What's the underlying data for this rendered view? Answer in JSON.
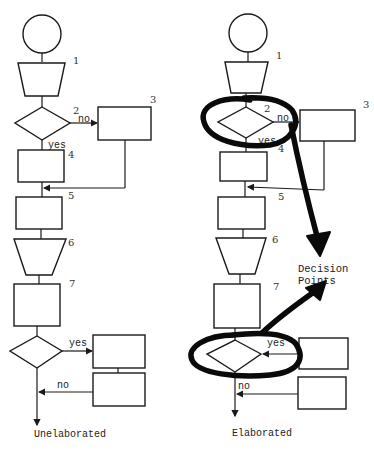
{
  "diagram": {
    "left": {
      "caption": "Unelaborated",
      "step_numbers": [
        "1",
        "2",
        "3",
        "4",
        "5",
        "6",
        "7"
      ],
      "labels": {
        "decision1_no": "no",
        "decision1_yes": "yes",
        "decision2_yes": "yes",
        "decision2_no": "no"
      }
    },
    "right": {
      "caption": "Elaborated",
      "step_numbers": [
        "1",
        "2",
        "3",
        "4",
        "5",
        "6",
        "7"
      ],
      "labels": {
        "decision1_no": "no",
        "decision1_yes": "yes",
        "decision2_yes": "yes",
        "decision2_no": "no"
      },
      "annotation": [
        "Decision",
        "Points"
      ]
    }
  }
}
